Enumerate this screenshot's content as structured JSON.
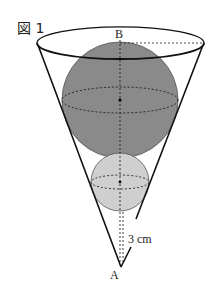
{
  "figure": {
    "title": "図 1",
    "labels": {
      "top_point": "B",
      "apex_point": "A",
      "distance": "3 cm"
    },
    "colors": {
      "large_sphere": "#8a8a8a",
      "small_sphere": "#cfcfcf",
      "outline": "#111111"
    },
    "shapes": {
      "cone": {
        "apex": [
          121,
          267
        ],
        "rim_center": [
          120,
          43
        ],
        "rim_rx": 83,
        "rim_ry": 16
      },
      "large_sphere": {
        "center": [
          120,
          100
        ],
        "r": 58
      },
      "small_sphere": {
        "center": [
          120,
          182
        ],
        "r": 29
      }
    }
  }
}
